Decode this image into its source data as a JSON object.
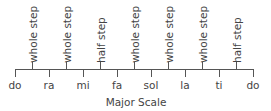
{
  "diagram": {
    "caption": "Major Scale",
    "notes": [
      "do",
      "ra",
      "mi",
      "fa",
      "sol",
      "la",
      "ti",
      "do"
    ],
    "steps": [
      "whole step",
      "whole step",
      "half step",
      "whole step",
      "whole step",
      "whole step",
      "half step"
    ]
  }
}
